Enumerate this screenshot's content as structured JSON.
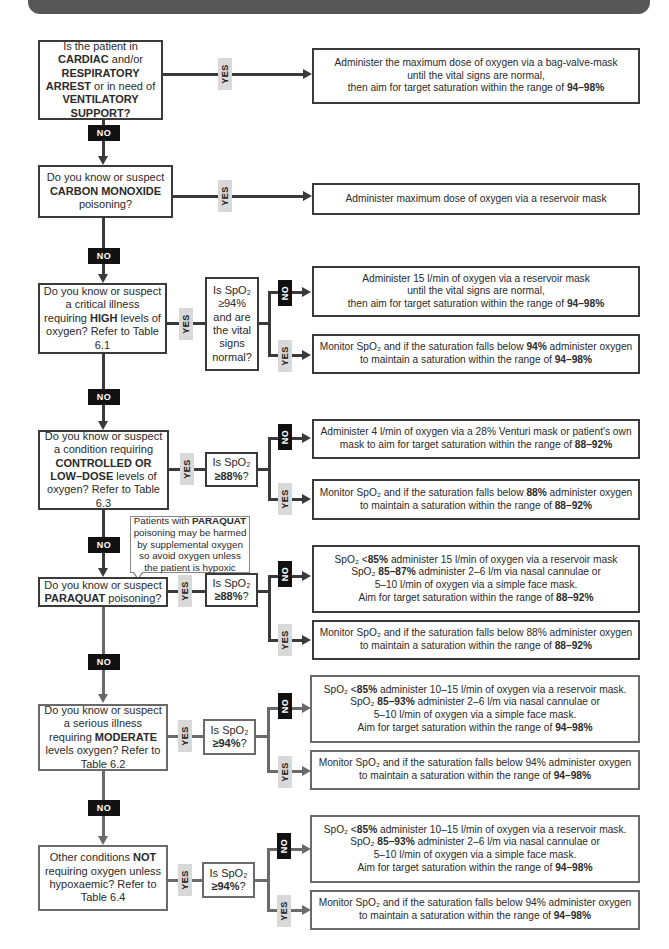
{
  "header": {
    "bar_color": "#575757"
  },
  "colors": {
    "line_dark": "#3a3a3a",
    "line_gray": "#6a6a6a",
    "no_tag_bg": "#111111",
    "yes_tag_bg": "#d9d9d9"
  },
  "labels": {
    "yes": "YES",
    "no": "NO"
  },
  "nodes": {
    "q1": {
      "pre": "Is the patient in ",
      "b1": "CARDIAC",
      "mid1": " and/or ",
      "b2": "RESPIRATORY ARREST",
      "mid2": " or in need of ",
      "b3": "VENTILATORY SUPPORT?"
    },
    "a1": {
      "l1": "Administer the maximum dose of oxygen via a bag-valve-mask",
      "l2": "until the vital signs are normal,",
      "l3": "then aim for target saturation within the range of ",
      "b": "94–98%"
    },
    "q2": {
      "l1": "Do you know or suspect",
      "b": "CARBON MONOXIDE",
      "l3": "poisoning?"
    },
    "a2": {
      "text": "Administer maximum dose of oxygen via a reservoir mask"
    },
    "q3": {
      "l1": "Do you know or suspect a critical illness requiring ",
      "b": "HIGH",
      "l2": " levels of oxygen? Refer to Table 6.1"
    },
    "c3": {
      "text": "Is SpO₂ ≥94% and are the vital signs normal?"
    },
    "a3_no": {
      "l1": "Administer 15 l/min of oxygen via a reservoir mask",
      "l2": "until the vital signs are normal,",
      "l3": "then aim for target saturation within the range of ",
      "b": "94–98%"
    },
    "a3_yes": {
      "pre": "Monitor SpO₂ and if the saturation falls below ",
      "b1": "94%",
      "mid": " administer oxygen to maintain a saturation within the range of ",
      "b2": "94–98%"
    },
    "q4": {
      "l1": "Do you know or suspect a condition requiring ",
      "b": "CONTROLLED OR LOW–DOSE",
      "l2": " levels of oxygen? Refer to Table 6.3"
    },
    "c4": {
      "pre": "Is SpO₂ ",
      "b": "≥88%",
      "post": "?"
    },
    "a4_no": {
      "l1": "Administer 4 l/min of oxygen via a 28% Venturi mask or patient's own mask to aim for target saturation within the range of ",
      "b": "88–92%"
    },
    "a4_yes": {
      "pre": "Monitor SpO₂ and if the saturation falls below ",
      "b1": "88%",
      "mid": " administer oxygen to maintain a saturation within the range of ",
      "b2": "88–92%"
    },
    "callout": {
      "pre": "Patients with ",
      "b": "PARAQUAT",
      "post": " poisoning may be harmed by supplemental oxygen so avoid oxygen unless the patient is hypoxic"
    },
    "q5": {
      "l1": "Do you know or suspect ",
      "b": "PARAQUAT",
      "l2": " poisoning?"
    },
    "c5": {
      "pre": "Is SpO₂ ",
      "b": "≥88%",
      "post": "?"
    },
    "a5_no": {
      "l1a": "SpO₂ <",
      "l1b": "85%",
      "l1c": " administer 15 l/min of oxygen via a reservoir mask",
      "l2a": "SpO₂ ",
      "l2b": "85–87%",
      "l2c": " administer 2–6 l/m via nasal cannulae or",
      "l3": "5–10 l/min of oxygen via a simple face mask.",
      "l4": "Aim for target saturation within the range of ",
      "l4b": "88–92%"
    },
    "a5_yes": {
      "pre": "Monitor SpO₂ and if the saturation falls below 88% administer oxygen to maintain a saturation within the range of ",
      "b2": "88–92%"
    },
    "q6": {
      "l1": "Do you know or suspect a serious illness requiring ",
      "b": "MODERATE",
      "l2": " levels oxygen? Refer to Table 6.2"
    },
    "c6": {
      "pre": "Is SpO₂ ",
      "b": "≥94%",
      "post": "?"
    },
    "a6_no": {
      "l1a": "SpO₂ <",
      "l1b": "85%",
      "l1c": " administer 10–15 l/min of oxygen via a reservoir mask.",
      "l2a": "SpO₂ ",
      "l2b": "85–93%",
      "l2c": " administer 2–6 l/m via nasal cannulae or",
      "l3": "5–10 l/min of oxygen via a simple face mask.",
      "l4": "Aim for target saturation within the range of ",
      "l4b": "94–98%"
    },
    "a6_yes": {
      "pre": "Monitor SpO₂ and if the saturation falls below 94% administer oxygen to maintain a saturation within the range of ",
      "b2": "94–98%"
    },
    "q7": {
      "l1": "Other conditions ",
      "b": "NOT",
      "l2": " requiring oxygen unless hypoxaemic? Refer to Table 6.4"
    },
    "c7": {
      "pre": "Is SpO₂ ",
      "b": "≥94%",
      "post": "?"
    },
    "a7_no": {
      "l1a": "SpO₂ <",
      "l1b": "85%",
      "l1c": " administer 10–15 l/min of oxygen via a reservoir mask.",
      "l2a": "SpO₂ ",
      "l2b": "85–93%",
      "l2c": " administer 2–6 l/m via nasal cannulae or",
      "l3": "5–10 l/min of oxygen via a simple face mask.",
      "l4": "Aim for target saturation within the range of ",
      "l4b": "94–98%"
    },
    "a7_yes": {
      "pre": "Monitor SpO₂ and if the saturation falls below 94% administer oxygen to maintain a saturation within the range of ",
      "b2": "94–98%"
    }
  }
}
